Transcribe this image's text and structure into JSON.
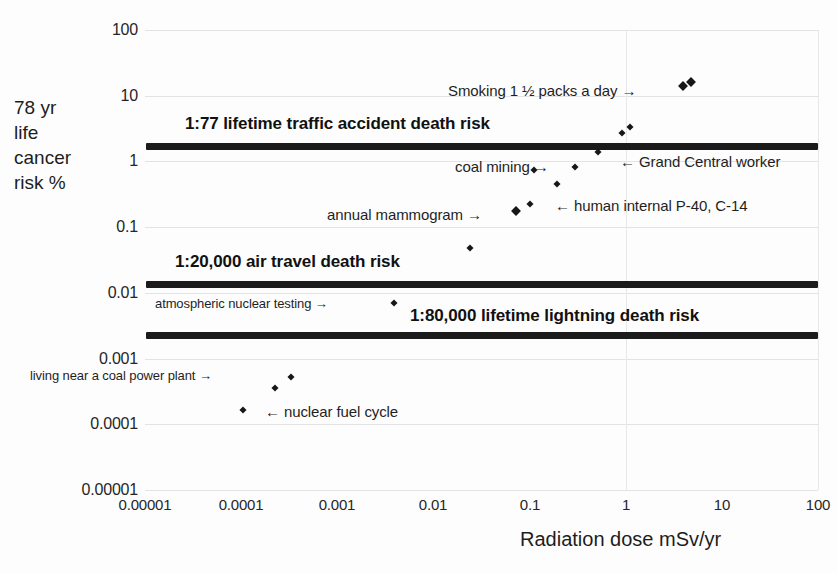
{
  "chart_data": {
    "type": "scatter",
    "title": "",
    "xlabel": "Radiation dose mSv/yr",
    "ylabel": "78 yr life cancer risk %",
    "xscale": "log",
    "yscale": "log",
    "xlim": [
      1e-05,
      100
    ],
    "ylim": [
      1e-05,
      100
    ],
    "grid": true,
    "legend": "none",
    "xticks": [
      "0.00001",
      "0.0001",
      "0.001",
      "0.01",
      "0.1",
      "1",
      "10",
      "100"
    ],
    "xtick_values": [
      1e-05,
      0.0001,
      0.001,
      0.01,
      0.1,
      1,
      10,
      100
    ],
    "yticks": [
      "100",
      "10",
      "1",
      "0.1",
      "0.01",
      "0.001",
      "0.0001",
      "0.00001"
    ],
    "ytick_values": [
      100,
      10,
      1,
      0.1,
      0.01,
      0.001,
      0.0001,
      1e-05
    ],
    "points": [
      {
        "label": "Smoking 1 1/2 packs a day",
        "x": 13.0,
        "y": 13.0,
        "px": 683,
        "py": 86,
        "size": "big"
      },
      {
        "label": "Smoking 1 1/2 packs a day",
        "x": 16.0,
        "y": 15.0,
        "px": 691,
        "py": 82,
        "size": "big"
      },
      {
        "label": "",
        "x": 2.4,
        "y": 2.1,
        "px": 622,
        "py": 133,
        "size": "normal"
      },
      {
        "label": "",
        "x": 3.1,
        "y": 2.6,
        "px": 630,
        "py": 127,
        "size": "normal"
      },
      {
        "label": "Grand Central worker",
        "x": 1.2,
        "y": 0.85,
        "px": 598,
        "py": 152,
        "size": "normal"
      },
      {
        "label": "coal mining",
        "x": 0.45,
        "y": 0.45,
        "px": 575,
        "py": 167,
        "size": "normal"
      },
      {
        "label": "coal mining",
        "x": 0.2,
        "y": 0.38,
        "px": 534,
        "py": 170,
        "size": "normal"
      },
      {
        "label": "",
        "x": 0.3,
        "y": 0.22,
        "px": 557,
        "py": 184,
        "size": "normal"
      },
      {
        "label": "human internal P-40, C-14",
        "x": 0.17,
        "y": 0.14,
        "px": 530,
        "py": 204,
        "size": "normal"
      },
      {
        "label": "annual mammogram",
        "x": 0.11,
        "y": 0.105,
        "px": 516,
        "py": 211,
        "size": "big"
      },
      {
        "label": "",
        "x": 0.037,
        "y": 0.03,
        "px": 470,
        "py": 248,
        "size": "normal"
      },
      {
        "label": "atmospheric nuclear testing",
        "x": 0.0028,
        "y": 0.0032,
        "px": 394,
        "py": 303,
        "size": "normal"
      },
      {
        "label": "living near a coal power plant",
        "x": 0.0003,
        "y": 0.00028,
        "px": 291,
        "py": 377,
        "size": "normal"
      },
      {
        "label": "living near a coal power plant",
        "x": 0.00022,
        "y": 0.00021,
        "px": 275,
        "py": 388,
        "size": "normal"
      },
      {
        "label": "nuclear fuel cycle",
        "x": 0.00012,
        "y": 0.0001,
        "px": 243,
        "py": 410,
        "size": "normal"
      }
    ],
    "benchmarks": [
      {
        "label": "1:77 lifetime traffic accident death risk",
        "y": 1.3,
        "py": 143,
        "label_px": 185,
        "label_py": 114
      },
      {
        "label": "1:20,000 air travel death risk",
        "y": 0.01,
        "py": 281,
        "label_px": 175,
        "label_py": 252
      },
      {
        "label": "1:80,000 lifetime lightning death risk",
        "y": 0.00125,
        "py": 332,
        "label_px": 410,
        "label_py": 306
      }
    ],
    "annotations": [
      {
        "text": "Smoking 1 ½ packs a day →",
        "px": 448,
        "py": 82,
        "size": "md"
      },
      {
        "text": "← Grand Central worker",
        "px": 620,
        "py": 153,
        "size": "md"
      },
      {
        "text": "coal mining →",
        "px": 455,
        "py": 158,
        "size": "md"
      },
      {
        "text": "← human internal P-40, C-14",
        "px": 555,
        "py": 197,
        "size": "md"
      },
      {
        "text": "annual mammogram →",
        "px": 327,
        "py": 206,
        "size": "md"
      },
      {
        "text": "atmospheric nuclear testing →",
        "px": 155,
        "py": 296,
        "size": "sm"
      },
      {
        "text": "living near a coal power plant →",
        "px": 30,
        "py": 368,
        "size": "sm"
      },
      {
        "text": "← nuclear fuel cycle",
        "px": 265,
        "py": 403,
        "size": "md"
      }
    ]
  },
  "axis": {
    "y_title_lines": [
      "78 yr",
      "life",
      "cancer",
      "risk %"
    ],
    "x_title": "Radiation dose mSv/yr"
  }
}
